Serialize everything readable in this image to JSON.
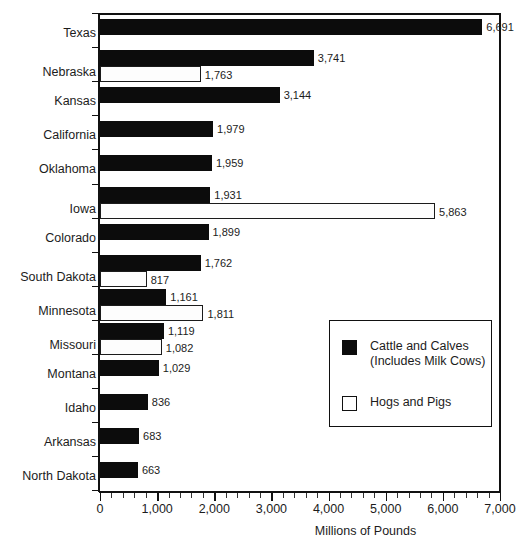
{
  "chart_data": {
    "type": "bar",
    "orientation": "horizontal",
    "title": "",
    "xlabel": "Millions of Pounds",
    "ylabel": "",
    "xlim": [
      0,
      7000
    ],
    "xticks": [
      0,
      1000,
      2000,
      3000,
      4000,
      5000,
      6000,
      7000
    ],
    "xtick_labels": [
      "0",
      "1,000",
      "2,000",
      "3,000",
      "4,000",
      "5,000",
      "6,000",
      "7,000"
    ],
    "minor_tick_interval": 200,
    "grid": false,
    "legend_position": "center-right",
    "categories": [
      "Texas",
      "Nebraska",
      "Kansas",
      "California",
      "Oklahoma",
      "Iowa",
      "Colorado",
      "South Dakota",
      "Minnesota",
      "Missouri",
      "Montana",
      "Idaho",
      "Arkansas",
      "North Dakota"
    ],
    "series": [
      {
        "name": "Cattle and Calves\n(Includes Milk Cows)",
        "color": "#0c0c0c",
        "style": "filled",
        "values": [
          6691,
          3741,
          3144,
          1979,
          1959,
          1931,
          1899,
          1762,
          1161,
          1119,
          1029,
          836,
          683,
          663
        ],
        "labels": [
          "6,691",
          "3,741",
          "3,144",
          "1,979",
          "1,959",
          "1,931",
          "1,899",
          "1,762",
          "1,161",
          "1,119",
          "1,029",
          "836",
          "683",
          "663"
        ]
      },
      {
        "name": "Hogs and Pigs",
        "color": "#ffffff",
        "style": "outlined",
        "values": [
          null,
          1763,
          null,
          null,
          null,
          5863,
          null,
          817,
          1811,
          1082,
          null,
          null,
          null,
          null
        ],
        "labels": [
          null,
          "1,763",
          null,
          null,
          null,
          "5,863",
          null,
          "817",
          "1,811",
          "1,082",
          null,
          null,
          null,
          null
        ]
      }
    ]
  },
  "legend": {
    "entries": [
      {
        "label": "Cattle and Calves\n(Includes Milk Cows)",
        "swatch": "filled-square-icon"
      },
      {
        "label": "Hogs and Pigs",
        "swatch": "open-square-icon"
      }
    ]
  }
}
